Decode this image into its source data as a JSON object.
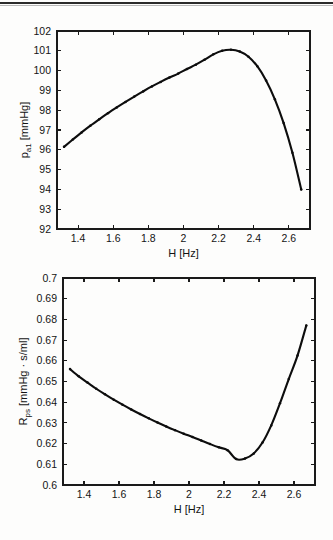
{
  "page": {
    "background": "#fdfdfc",
    "ink": "#0d0d0d",
    "rule_color": "#2b2b2b"
  },
  "figures": [
    {
      "id": "pa1",
      "xlabel": "H [Hz]",
      "ylabel_main": "p",
      "ylabel_sub": "a1",
      "ylabel_unit": " [mmHg]",
      "ylabel_full": "p_a1 [mmHg]"
    },
    {
      "id": "rps",
      "xlabel": "H [Hz]",
      "ylabel_main": "R",
      "ylabel_sub": "ps",
      "ylabel_unit": " [mmHg · s/ml]",
      "ylabel_full": "R_ps [mmHg · s/ml]"
    }
  ],
  "chart_data": [
    {
      "type": "line",
      "id": "pa1",
      "title": "",
      "xlabel": "H [Hz]",
      "ylabel": "p_a1 [mmHg]",
      "xlim": [
        1.28,
        2.72
      ],
      "ylim": [
        92,
        102
      ],
      "xticks": [
        1.4,
        1.6,
        1.8,
        2.0,
        2.2,
        2.4,
        2.6
      ],
      "xticklabels": [
        "1.4",
        "1.6",
        "1.8",
        "2",
        "2.2",
        "2.4",
        "2.6"
      ],
      "yticks": [
        92,
        93,
        94,
        95,
        96,
        97,
        98,
        99,
        100,
        101,
        102
      ],
      "yticklabels": [
        "92",
        "93",
        "94",
        "95",
        "96",
        "97",
        "98",
        "99",
        "100",
        "101",
        "102"
      ],
      "grid": false,
      "legend": null,
      "marker": "dot",
      "x": [
        1.32,
        1.37,
        1.42,
        1.47,
        1.52,
        1.57,
        1.62,
        1.67,
        1.72,
        1.77,
        1.82,
        1.87,
        1.92,
        1.97,
        2.02,
        2.07,
        2.12,
        2.17,
        2.22,
        2.27,
        2.32,
        2.37,
        2.42,
        2.47,
        2.52,
        2.57,
        2.62,
        2.67
      ],
      "y": [
        96.15,
        96.52,
        96.88,
        97.22,
        97.54,
        97.85,
        98.14,
        98.42,
        98.69,
        98.95,
        99.2,
        99.43,
        99.65,
        99.85,
        100.08,
        100.3,
        100.55,
        100.82,
        101.0,
        101.05,
        100.96,
        100.7,
        100.22,
        99.5,
        98.55,
        97.35,
        95.85,
        94.0
      ]
    },
    {
      "type": "line",
      "id": "rps",
      "title": "",
      "xlabel": "H [Hz]",
      "ylabel": "R_ps [mmHg · s/ml]",
      "xlim": [
        1.28,
        2.72
      ],
      "ylim": [
        0.6,
        0.7
      ],
      "xticks": [
        1.4,
        1.6,
        1.8,
        2.0,
        2.2,
        2.4,
        2.6
      ],
      "xticklabels": [
        "1.4",
        "1.6",
        "1.8",
        "2",
        "2.2",
        "2.4",
        "2.6"
      ],
      "yticks": [
        0.6,
        0.61,
        0.62,
        0.63,
        0.64,
        0.65,
        0.66,
        0.67,
        0.68,
        0.69,
        0.7
      ],
      "yticklabels": [
        "0.6",
        "0.61",
        "0.62",
        "0.63",
        "0.64",
        "0.65",
        "0.66",
        "0.67",
        "0.68",
        "0.69",
        "0.7"
      ],
      "grid": false,
      "legend": null,
      "marker": "dot",
      "x": [
        1.32,
        1.37,
        1.42,
        1.47,
        1.52,
        1.57,
        1.62,
        1.67,
        1.72,
        1.77,
        1.82,
        1.87,
        1.92,
        1.97,
        2.02,
        2.07,
        2.12,
        2.17,
        2.22,
        2.27,
        2.32,
        2.37,
        2.42,
        2.47,
        2.52,
        2.57,
        2.62,
        2.67
      ],
      "y": [
        0.656,
        0.6525,
        0.6495,
        0.6465,
        0.6438,
        0.6412,
        0.6388,
        0.6365,
        0.6343,
        0.6322,
        0.6302,
        0.6283,
        0.6265,
        0.6248,
        0.6232,
        0.6215,
        0.6198,
        0.6182,
        0.6168,
        0.6125,
        0.6128,
        0.6152,
        0.6205,
        0.6288,
        0.6395,
        0.6512,
        0.6625,
        0.677
      ]
    }
  ]
}
